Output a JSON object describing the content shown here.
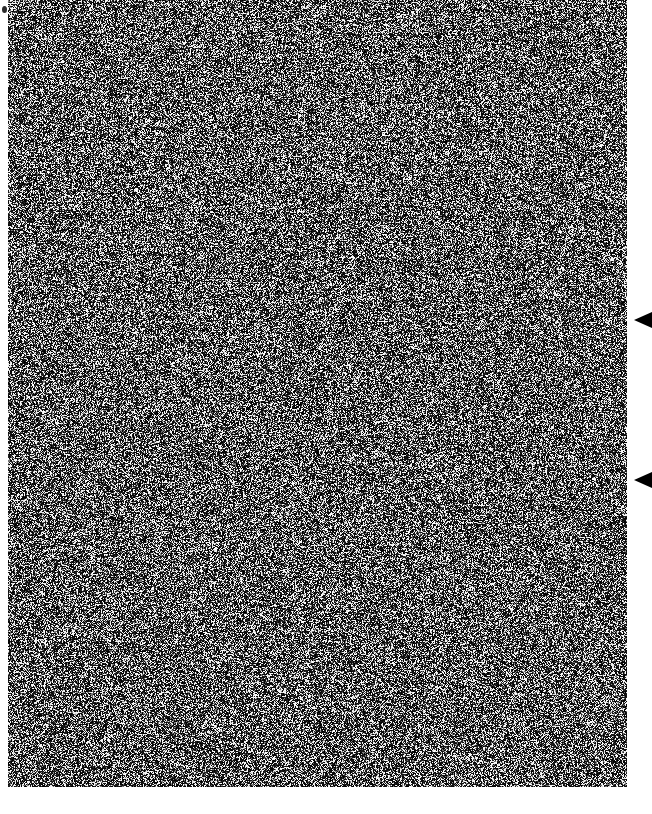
{
  "canvas": {
    "width": 652,
    "height": 814,
    "background_color": "#ffffff"
  },
  "noise_field": {
    "name": "speckle-noise-region",
    "description": "dense black-and-white salt-and-pepper random noise texture",
    "x": 8,
    "y": 0,
    "width": 619,
    "height": 787,
    "dark_color": "#101010",
    "light_color": "#f2f2f2",
    "mid_color": "#787878",
    "dark_fraction": 0.56,
    "light_fraction": 0.3,
    "mid_fraction": 0.14,
    "pixel_scale": 1,
    "seed": 20240517
  },
  "markers": [
    {
      "name": "edge-marker-triangle-1",
      "shape": "triangle-left-icon",
      "color": "#000000",
      "center_y": 320,
      "apex_x": 634,
      "base_x": 652,
      "width": 18,
      "height": 16
    },
    {
      "name": "edge-marker-triangle-2",
      "shape": "triangle-left-icon",
      "color": "#000000",
      "center_y": 480,
      "apex_x": 634,
      "base_x": 652,
      "width": 18,
      "height": 16
    }
  ],
  "corner_speck": {
    "name": "corner-speck",
    "x": 2,
    "y": 6,
    "width": 5,
    "height": 7,
    "color": "#2b2b2b"
  }
}
